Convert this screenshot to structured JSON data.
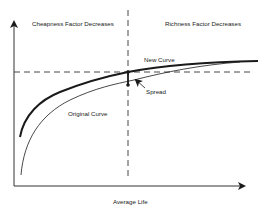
{
  "diagram": {
    "regions": {
      "left_label": "Cheapness Factor Decreases",
      "right_label": "Richness Factor Decreases"
    },
    "curves": {
      "new_curve_label": "New Curve",
      "original_curve_label": "Original Curve"
    },
    "annotations": {
      "spread_label": "Spread"
    },
    "axes": {
      "x_label": "Average Life",
      "y_label": ""
    },
    "colors": {
      "line": "#1a1a1a",
      "axis": "#333333",
      "dashed": "#333333",
      "background": "#ffffff"
    }
  }
}
